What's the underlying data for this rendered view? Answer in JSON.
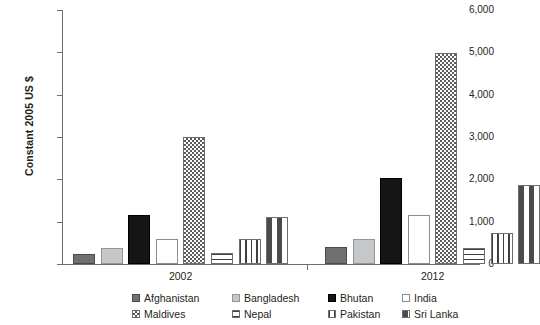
{
  "axes": {
    "ylabel": "Constant 2005 US $",
    "yticks": [
      "0",
      "1,000",
      "2,000",
      "3,000",
      "4,000",
      "5,000",
      "6,000"
    ],
    "xticks": [
      "2002",
      "2012"
    ]
  },
  "legend": {
    "row1": [
      {
        "label": "Afghanistan",
        "pattern": "solid-dark-gray"
      },
      {
        "label": "Bangladesh",
        "pattern": "solid-light-gray"
      },
      {
        "label": "Bhutan",
        "pattern": "solid-black"
      },
      {
        "label": "India",
        "pattern": "empty-white"
      }
    ],
    "row2": [
      {
        "label": "Maldives",
        "pattern": "checkerboard"
      },
      {
        "label": "Nepal",
        "pattern": "horizontal-lines"
      },
      {
        "label": "Pakistan",
        "pattern": "vertical-lines"
      },
      {
        "label": "Sri Lanka",
        "pattern": "dashes"
      }
    ]
  },
  "chart_data": {
    "type": "bar",
    "title": "",
    "xlabel": "",
    "ylabel": "Constant 2005 US $",
    "ylim": [
      0,
      6000
    ],
    "ytick_step": 1000,
    "grid": false,
    "legend_position": "bottom",
    "categories": [
      "2002",
      "2012"
    ],
    "series": [
      {
        "name": "Afghanistan",
        "values": [
          230,
          400
        ]
      },
      {
        "name": "Bangladesh",
        "values": [
          380,
          580
        ]
      },
      {
        "name": "Bhutan",
        "values": [
          1150,
          2040
        ]
      },
      {
        "name": "India",
        "values": [
          600,
          1150
        ]
      },
      {
        "name": "Maldives",
        "values": [
          3010,
          4980
        ]
      },
      {
        "name": "Nepal",
        "values": [
          250,
          380
        ]
      },
      {
        "name": "Pakistan",
        "values": [
          580,
          730
        ]
      },
      {
        "name": "Sri Lanka",
        "values": [
          1110,
          1870
        ]
      }
    ]
  }
}
